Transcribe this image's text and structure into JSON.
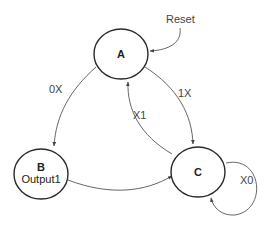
{
  "diagram": {
    "type": "state-machine",
    "states": [
      {
        "id": "A",
        "label": "A",
        "output": ""
      },
      {
        "id": "B",
        "label": "B",
        "output": "Output1"
      },
      {
        "id": "C",
        "label": "C",
        "output": ""
      }
    ],
    "reset": {
      "label": "Reset",
      "target": "A"
    },
    "transitions": [
      {
        "from": "A",
        "to": "B",
        "label": "0X"
      },
      {
        "from": "A",
        "to": "C",
        "label": "1X"
      },
      {
        "from": "C",
        "to": "A",
        "label": "X1"
      },
      {
        "from": "B",
        "to": "C",
        "label": ""
      },
      {
        "from": "C",
        "to": "C",
        "label": "X0"
      }
    ],
    "colors": {
      "stroke": "#2a2a2a",
      "edge": "#555555",
      "text": "#444444",
      "background": "#ffffff"
    }
  }
}
